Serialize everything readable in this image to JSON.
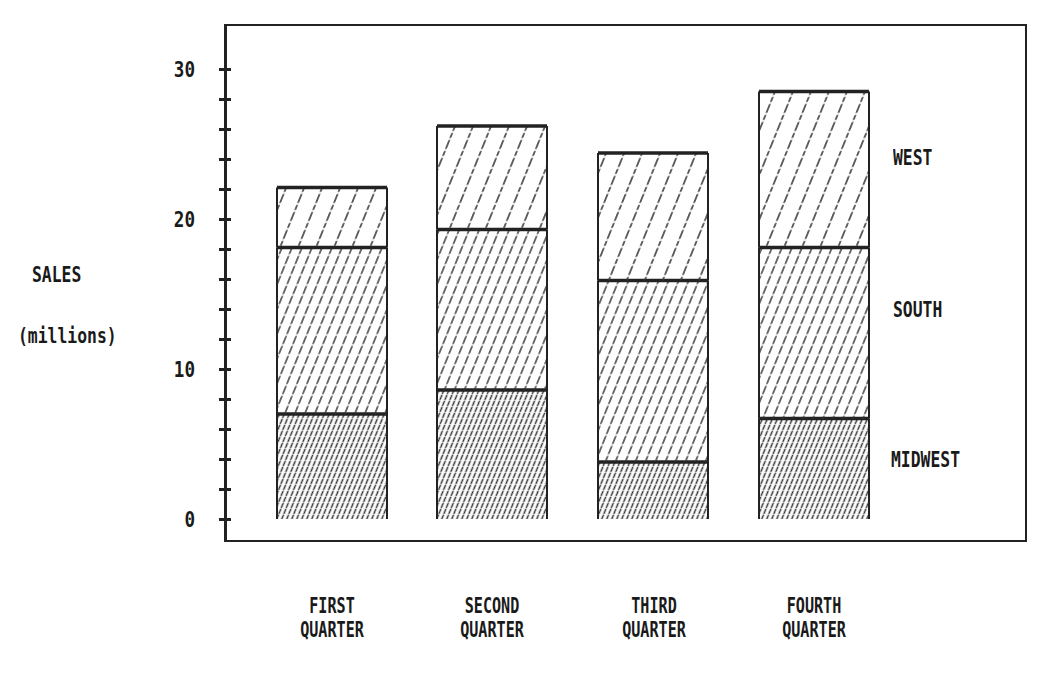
{
  "chart_data": {
    "type": "bar",
    "stacked": true,
    "title": "",
    "xlabel": "",
    "ylabel": "SALES (millions)",
    "ylabel_lines": [
      "SALES",
      "(millions)"
    ],
    "ylim": [
      0,
      30
    ],
    "y_ticks": [
      0,
      10,
      20,
      30
    ],
    "y_tick_labels": [
      "0",
      "10",
      "20",
      "30"
    ],
    "minor_tick_step": 2,
    "categories": [
      "FIRST QUARTER",
      "SECOND QUARTER",
      "THIRD QUARTER",
      "FOURTH QUARTER"
    ],
    "category_lines": [
      [
        "FIRST",
        "QUARTER"
      ],
      [
        "SECOND",
        "QUARTER"
      ],
      [
        "THIRD",
        "QUARTER"
      ],
      [
        "FOURTH",
        "QUARTER"
      ]
    ],
    "series": [
      {
        "name": "MIDWEST",
        "values": [
          7.0,
          8.6,
          3.8,
          6.7
        ],
        "pattern": "dense-diagonal"
      },
      {
        "name": "SOUTH",
        "values": [
          11.1,
          10.7,
          12.1,
          11.4
        ],
        "pattern": "medium-diagonal"
      },
      {
        "name": "WEST",
        "values": [
          4.0,
          6.9,
          8.5,
          10.4
        ],
        "pattern": "sparse-diagonal"
      }
    ],
    "totals": [
      22.1,
      26.2,
      24.4,
      28.5
    ],
    "legend": [
      "WEST",
      "SOUTH",
      "MIDWEST"
    ],
    "legend_position": "right",
    "grid": false
  },
  "colors": {
    "ink": "#222222",
    "background": "#ffffff"
  }
}
